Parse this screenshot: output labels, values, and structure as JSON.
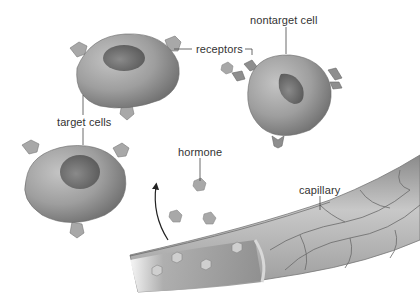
{
  "diagram": {
    "labels": {
      "receptors": "receptors",
      "nontarget_cell": "nontarget cell",
      "target_cells": "target cells",
      "hormone": "hormone",
      "capillary": "capillary"
    },
    "elements": {
      "target_cells_count": 2,
      "nontarget_cells_count": 1,
      "free_hormone_molecules": 5,
      "hormones_in_capillary": 4
    },
    "colors": {
      "background": "#ffffff",
      "cell": "#9a9a9a",
      "nucleus": "#6e6e6e",
      "receptor": "#8c8c8c",
      "hormone": "#a8a8a8",
      "capillary": "#b5b5b5",
      "label_text": "#333333",
      "leader_line": "#444444"
    }
  }
}
